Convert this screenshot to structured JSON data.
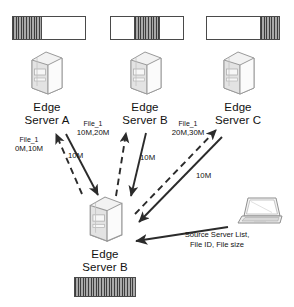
{
  "diagram": {
    "colors": {
      "stroke": "#3d3d3d",
      "fill_hatch": "#8d8d8d",
      "background": "#ffffff",
      "text": "#111111"
    },
    "top_servers": [
      {
        "id": "edge-server-a",
        "label_line1": "Edge",
        "label_line2": "Server A",
        "icon": "server-tower-icon",
        "bar": {
          "name": "file-chunk-bar-a",
          "segments": [
            {
              "state": "filled",
              "percent": 40
            },
            {
              "state": "empty",
              "percent": 60
            }
          ]
        }
      },
      {
        "id": "edge-server-b",
        "label_line1": "Edge",
        "label_line2": "Server B",
        "icon": "server-tower-icon",
        "bar": {
          "name": "file-chunk-bar-b",
          "segments": [
            {
              "state": "empty",
              "percent": 33
            },
            {
              "state": "filled",
              "percent": 34
            },
            {
              "state": "empty",
              "percent": 33
            }
          ]
        }
      },
      {
        "id": "edge-server-c",
        "label_line1": "Edge",
        "label_line2": "Server C",
        "icon": "server-tower-icon",
        "bar": {
          "name": "file-chunk-bar-c",
          "segments": [
            {
              "state": "empty",
              "percent": 74
            },
            {
              "state": "filled",
              "percent": 26
            }
          ]
        }
      }
    ],
    "requests": [
      {
        "id": "request-a",
        "file": "File_1",
        "range": "0M,10M",
        "arrow": "dashed-up-arrow",
        "target": "edge-server-a"
      },
      {
        "id": "request-b",
        "file": "File_1",
        "range": "10M,20M",
        "arrow": "dashed-up-arrow",
        "target": "edge-server-b"
      },
      {
        "id": "request-c",
        "file": "File_1",
        "range": "20M,30M",
        "arrow": "dashed-up-arrow",
        "target": "edge-server-c"
      }
    ],
    "transfers": [
      {
        "id": "transfer-a",
        "size": "10M",
        "arrow": "solid-down-arrow",
        "source": "edge-server-a"
      },
      {
        "id": "transfer-b",
        "size": "10M",
        "arrow": "solid-down-arrow",
        "source": "edge-server-b"
      },
      {
        "id": "transfer-c",
        "size": "10M",
        "arrow": "solid-down-arrow",
        "source": "edge-server-c"
      }
    ],
    "central_server": {
      "id": "central-edge-server-b",
      "label_line1": "Edge",
      "label_line2": "Server B",
      "icon": "server-tower-icon",
      "bar": {
        "name": "file-chunk-bar-complete",
        "segments": [
          {
            "state": "filled",
            "percent": 100
          }
        ]
      }
    },
    "client": {
      "id": "client-laptop",
      "icon": "laptop-icon",
      "arrow": "solid-left-arrow",
      "message_line1": "Source Server List,",
      "message_line2": "File ID, File size"
    }
  }
}
